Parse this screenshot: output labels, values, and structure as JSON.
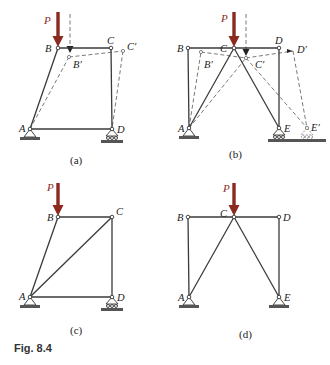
{
  "figure": {
    "caption": "Fig. 8.4",
    "load_label": "P",
    "load_color": "#8b2a1e",
    "panels": [
      {
        "id": "a",
        "caption": "(a)",
        "labels": {
          "A": "A",
          "B": "B",
          "C": "C",
          "D": "D",
          "B_prime": "B′",
          "C_prime": "C′"
        }
      },
      {
        "id": "b",
        "caption": "(b)",
        "labels": {
          "A": "A",
          "B": "B",
          "C": "C",
          "D": "D",
          "E": "E",
          "B_prime": "B′",
          "C_prime": "C′",
          "D_prime": "D′",
          "E_prime": "E′"
        }
      },
      {
        "id": "c",
        "caption": "(c)",
        "labels": {
          "A": "A",
          "B": "B",
          "C": "C",
          "D": "D"
        }
      },
      {
        "id": "d",
        "caption": "(d)",
        "labels": {
          "A": "A",
          "B": "B",
          "C": "C",
          "D": "D",
          "E": "E"
        }
      }
    ]
  }
}
